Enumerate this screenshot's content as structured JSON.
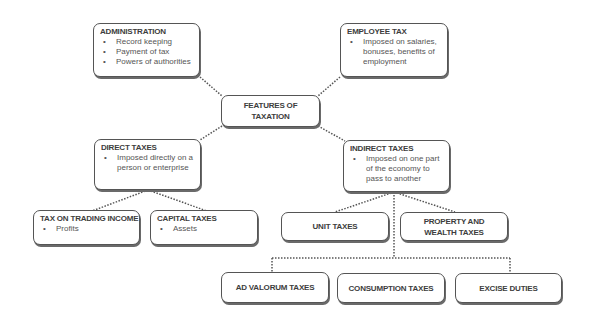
{
  "diagram": {
    "root": {
      "title": "FEATURES OF TAXATION"
    },
    "administration": {
      "title": "ADMINISTRATION",
      "bullets": [
        "Record keeping",
        "Payment of tax",
        "Powers of authorities"
      ]
    },
    "employee_tax": {
      "title": "EMPLOYEE TAX",
      "bullets": [
        "Imposed on salaries, bonuses, benefits of employment"
      ]
    },
    "direct_taxes": {
      "title": "DIRECT TAXES",
      "bullets": [
        "Imposed directly on a person or enterprise"
      ]
    },
    "indirect_taxes": {
      "title": "INDIRECT TAXES",
      "bullets": [
        "Imposed on one part of the economy to pass to another"
      ]
    },
    "tax_on_trading_income": {
      "title": "TAX ON TRADING INCOME",
      "bullets": [
        "Profits"
      ]
    },
    "capital_taxes": {
      "title": "CAPITAL TAXES",
      "bullets": [
        "Assets"
      ]
    },
    "unit_taxes": {
      "title": "UNIT TAXES"
    },
    "property_wealth_taxes": {
      "title": "PROPERTY AND WEALTH TAXES"
    },
    "ad_valorum_taxes": {
      "title": "AD VALORUM TAXES"
    },
    "consumption_taxes": {
      "title": "CONSUMPTION TAXES"
    },
    "excise_duties": {
      "title": "EXCISE DUTIES"
    },
    "style": {
      "border_color": "#555555",
      "connector_color": "#555555",
      "text_color": "#3d3d3d"
    }
  }
}
